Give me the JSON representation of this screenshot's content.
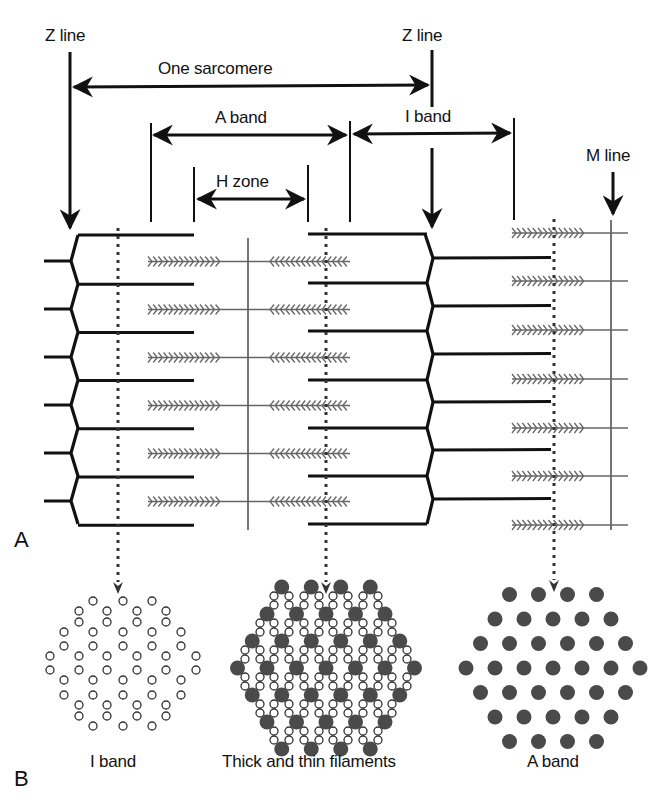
{
  "diagram": {
    "panels": [
      {
        "id": "A",
        "label": "A"
      },
      {
        "id": "B",
        "label": "B"
      }
    ],
    "labels": {
      "z_line_left": "Z line",
      "z_line_right": "Z line",
      "one_sarcomere": "One sarcomere",
      "a_band": "A band",
      "i_band": "I band",
      "h_zone": "H zone",
      "m_line": "M line"
    },
    "cross_sections": [
      {
        "label": "I band",
        "content": "thin filaments only",
        "fill": "hollow"
      },
      {
        "label": "Thick and thin filaments",
        "content": "thick + thin filaments overlap",
        "fill": "mixed"
      },
      {
        "label": "A band",
        "content": "thick filaments only",
        "fill": "solid"
      }
    ],
    "colors": {
      "thin_filament": "#111111",
      "thick_filament": "#666666",
      "thick_dot": "#4a4a4a",
      "background": "#ffffff"
    }
  }
}
